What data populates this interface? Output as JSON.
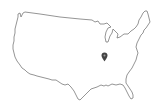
{
  "map": {
    "region": "contiguous-united-states",
    "style": "outline",
    "outline_color": "#7a7a7a",
    "background_color": "#ffffff",
    "marker": {
      "icon": "location-marker-icon",
      "color": "#444444",
      "x": 104,
      "y": 57
    }
  }
}
